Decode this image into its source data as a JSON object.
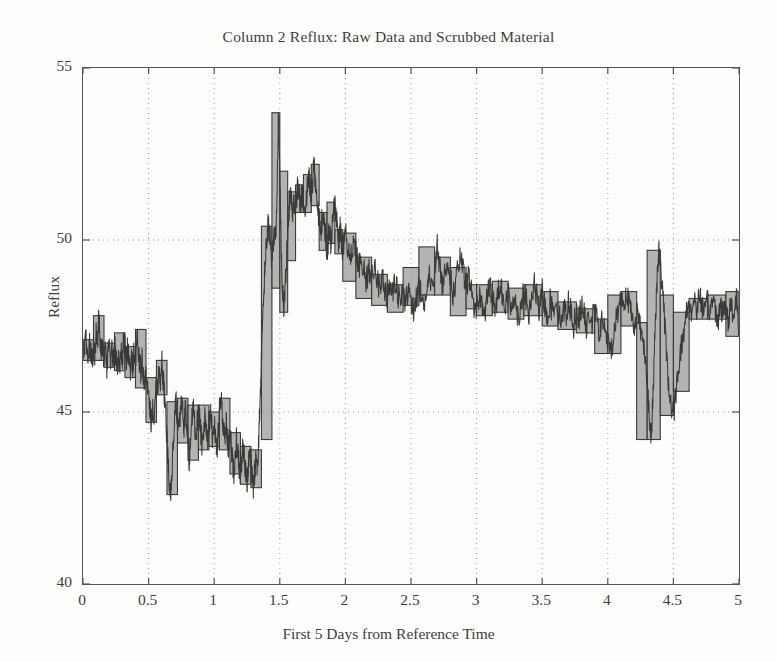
{
  "figure": {
    "title": "Column 2 Reflux: Raw Data and Scrubbed Material",
    "ylabel": "Reflux",
    "xlabel": "First 5 Days from Reference Time"
  },
  "style": {
    "background": "#fdfdfb",
    "axis_color": "#555555",
    "grid_color": "#9a9a9a",
    "raw_line_color": "#3a3a3a",
    "band_fill_color": "#9d9d9d",
    "band_edge_color": "#3a3a3a",
    "text_color": "#3d3d3d"
  },
  "chart_data": {
    "type": "line",
    "title": "Column 2 Reflux: Raw Data and Scrubbed Material",
    "xlabel": "First 5 Days from Reference Time",
    "ylabel": "Reflux",
    "xlim": [
      0,
      5
    ],
    "ylim": [
      40,
      55
    ],
    "xticks": [
      0,
      0.5,
      1,
      1.5,
      2,
      2.5,
      3,
      3.5,
      4,
      4.5,
      5
    ],
    "xtick_labels": [
      "0",
      "0.5",
      "1",
      "1.5",
      "2",
      "2.5",
      "3",
      "3.5",
      "4",
      "4.5",
      "5"
    ],
    "yticks": [
      40,
      45,
      50,
      55
    ],
    "ytick_labels": [
      "40",
      "45",
      "50",
      "55"
    ],
    "grid": true,
    "grid_style": "dotted",
    "legend": null,
    "legend_position": "none",
    "series": [
      {
        "name": "Raw Data",
        "kind": "line",
        "x": [
          0.0,
          0.01,
          0.02,
          0.03,
          0.04,
          0.05,
          0.06,
          0.07,
          0.08,
          0.09,
          0.1,
          0.11,
          0.12,
          0.13,
          0.14,
          0.15,
          0.16,
          0.17,
          0.18,
          0.19,
          0.2,
          0.21,
          0.22,
          0.23,
          0.24,
          0.25,
          0.26,
          0.27,
          0.28,
          0.29,
          0.3,
          0.31,
          0.32,
          0.33,
          0.34,
          0.35,
          0.36,
          0.37,
          0.38,
          0.39,
          0.4,
          0.41,
          0.42,
          0.43,
          0.44,
          0.45,
          0.46,
          0.47,
          0.48,
          0.49,
          0.5,
          0.51,
          0.52,
          0.53,
          0.54,
          0.55,
          0.56,
          0.57,
          0.58,
          0.59,
          0.6,
          0.61,
          0.62,
          0.63,
          0.64,
          0.65,
          0.66,
          0.67,
          0.68,
          0.69,
          0.7,
          0.71,
          0.72,
          0.73,
          0.74,
          0.75,
          0.76,
          0.77,
          0.78,
          0.79,
          0.8,
          0.81,
          0.82,
          0.83,
          0.84,
          0.85,
          0.86,
          0.87,
          0.88,
          0.89,
          0.9,
          0.91,
          0.92,
          0.93,
          0.94,
          0.95,
          0.96,
          0.97,
          0.98,
          0.99,
          1.0,
          1.01,
          1.02,
          1.03,
          1.04,
          1.05,
          1.06,
          1.07,
          1.08,
          1.09,
          1.1,
          1.11,
          1.12,
          1.13,
          1.14,
          1.15,
          1.16,
          1.17,
          1.18,
          1.19,
          1.2,
          1.21,
          1.22,
          1.23,
          1.24,
          1.25,
          1.26,
          1.27,
          1.28,
          1.29,
          1.3,
          1.31,
          1.32,
          1.33,
          1.34,
          1.35,
          1.36,
          1.37,
          1.38,
          1.39,
          1.4,
          1.41,
          1.42,
          1.43,
          1.44,
          1.45,
          1.46,
          1.47,
          1.48,
          1.49,
          1.5,
          1.51,
          1.52,
          1.53,
          1.54,
          1.55,
          1.56,
          1.57,
          1.58,
          1.59,
          1.6,
          1.61,
          1.62,
          1.63,
          1.64,
          1.65,
          1.66,
          1.67,
          1.68,
          1.69,
          1.7,
          1.71,
          1.72,
          1.73,
          1.74,
          1.75,
          1.76,
          1.77,
          1.78,
          1.79,
          1.8,
          1.81,
          1.82,
          1.83,
          1.84,
          1.85,
          1.86,
          1.87,
          1.88,
          1.89,
          1.9,
          1.91,
          1.92,
          1.93,
          1.94,
          1.95,
          1.96,
          1.97,
          1.98,
          1.99,
          2.0,
          2.02,
          2.04,
          2.06,
          2.08,
          2.1,
          2.12,
          2.14,
          2.16,
          2.18,
          2.2,
          2.22,
          2.24,
          2.26,
          2.28,
          2.3,
          2.32,
          2.34,
          2.36,
          2.38,
          2.4,
          2.42,
          2.44,
          2.46,
          2.48,
          2.5,
          2.52,
          2.54,
          2.56,
          2.58,
          2.6,
          2.62,
          2.64,
          2.66,
          2.68,
          2.7,
          2.72,
          2.74,
          2.76,
          2.78,
          2.8,
          2.82,
          2.84,
          2.86,
          2.88,
          2.9,
          2.92,
          2.94,
          2.96,
          2.98,
          3.0,
          3.02,
          3.04,
          3.06,
          3.08,
          3.1,
          3.12,
          3.14,
          3.16,
          3.18,
          3.2,
          3.22,
          3.24,
          3.26,
          3.28,
          3.3,
          3.32,
          3.34,
          3.36,
          3.38,
          3.4,
          3.42,
          3.44,
          3.46,
          3.48,
          3.5,
          3.52,
          3.54,
          3.56,
          3.58,
          3.6,
          3.62,
          3.64,
          3.66,
          3.68,
          3.7,
          3.72,
          3.74,
          3.76,
          3.78,
          3.8,
          3.82,
          3.84,
          3.86,
          3.88,
          3.9,
          3.92,
          3.94,
          3.96,
          3.98,
          4.0,
          4.02,
          4.04,
          4.06,
          4.08,
          4.1,
          4.12,
          4.14,
          4.16,
          4.18,
          4.2,
          4.22,
          4.24,
          4.26,
          4.28,
          4.3,
          4.31,
          4.32,
          4.33,
          4.34,
          4.35,
          4.36,
          4.37,
          4.38,
          4.39,
          4.4,
          4.42,
          4.44,
          4.46,
          4.48,
          4.5,
          4.52,
          4.54,
          4.56,
          4.58,
          4.6,
          4.62,
          4.64,
          4.66,
          4.68,
          4.7,
          4.72,
          4.74,
          4.76,
          4.78,
          4.8,
          4.82,
          4.84,
          4.86,
          4.88,
          4.9,
          4.92,
          4.94,
          4.96,
          4.98,
          5.0
        ],
        "y": [
          46.9,
          46.6,
          47.1,
          46.8,
          46.5,
          47.0,
          46.7,
          46.4,
          46.9,
          46.6,
          47.3,
          46.8,
          47.8,
          47.1,
          46.6,
          47.0,
          46.5,
          46.8,
          46.3,
          46.7,
          46.9,
          46.4,
          46.8,
          46.5,
          47.0,
          46.6,
          46.2,
          46.7,
          46.4,
          46.9,
          46.5,
          47.3,
          46.8,
          46.4,
          46.9,
          46.5,
          46.1,
          46.6,
          46.3,
          46.8,
          46.4,
          47.4,
          46.9,
          46.5,
          46.2,
          46.6,
          46.1,
          45.7,
          46.2,
          45.8,
          45.4,
          45.0,
          44.7,
          45.2,
          44.9,
          45.5,
          46.0,
          45.6,
          46.3,
          45.9,
          46.5,
          46.0,
          45.5,
          44.9,
          44.2,
          43.4,
          42.7,
          42.6,
          43.5,
          44.2,
          44.9,
          45.3,
          44.8,
          44.3,
          44.9,
          45.4,
          45.0,
          44.5,
          45.1,
          44.6,
          44.1,
          43.6,
          44.2,
          44.8,
          45.2,
          44.7,
          44.2,
          44.7,
          45.2,
          44.8,
          44.3,
          43.9,
          44.4,
          44.9,
          44.5,
          44.0,
          44.5,
          45.0,
          44.6,
          44.2,
          44.7,
          44.3,
          43.9,
          44.4,
          44.9,
          45.4,
          45.0,
          44.6,
          44.2,
          44.7,
          44.3,
          43.9,
          44.4,
          44.0,
          43.6,
          43.2,
          43.7,
          44.2,
          43.8,
          43.4,
          43.0,
          43.5,
          44.0,
          43.6,
          43.2,
          42.9,
          43.4,
          43.9,
          43.5,
          43.1,
          42.8,
          43.3,
          43.8,
          43.4,
          44.2,
          45.4,
          46.6,
          47.6,
          48.6,
          49.4,
          50.0,
          50.4,
          50.2,
          49.8,
          49.4,
          49.9,
          50.4,
          50.2,
          51.5,
          53.7,
          52.0,
          49.9,
          48.6,
          47.9,
          48.6,
          49.4,
          50.2,
          50.9,
          51.4,
          51.1,
          50.8,
          51.2,
          50.9,
          51.3,
          51.6,
          51.3,
          51.0,
          51.4,
          51.1,
          50.8,
          51.2,
          51.5,
          51.9,
          51.6,
          51.3,
          51.7,
          52.2,
          51.8,
          51.4,
          51.0,
          50.6,
          50.2,
          50.5,
          50.8,
          50.4,
          50.1,
          49.7,
          50.0,
          50.3,
          49.9,
          50.4,
          50.8,
          51.1,
          50.7,
          50.3,
          49.9,
          50.3,
          50.0,
          49.6,
          49.9,
          50.2,
          49.8,
          49.5,
          49.9,
          49.6,
          49.2,
          49.5,
          49.1,
          48.8,
          49.2,
          48.9,
          49.3,
          48.9,
          48.6,
          49.0,
          48.6,
          48.3,
          48.7,
          48.4,
          48.8,
          48.4,
          48.1,
          48.5,
          48.2,
          48.6,
          48.3,
          47.9,
          48.3,
          48.7,
          48.4,
          48.1,
          48.5,
          48.9,
          48.6,
          49.2,
          49.8,
          49.2,
          48.7,
          49.1,
          49.5,
          48.9,
          48.4,
          48.8,
          49.2,
          49.5,
          49.0,
          48.6,
          49.0,
          48.5,
          48.1,
          48.0,
          48.4,
          48.2,
          47.8,
          48.3,
          48.7,
          48.3,
          47.9,
          48.4,
          48.8,
          48.4,
          48.0,
          48.5,
          48.0,
          48.4,
          48.1,
          47.7,
          48.2,
          48.6,
          48.2,
          47.8,
          48.3,
          48.7,
          48.3,
          47.9,
          48.5,
          48.1,
          47.8,
          48.2,
          47.9,
          48.3,
          48.0,
          47.6,
          48.1,
          47.8,
          48.2,
          47.9,
          47.5,
          48.0,
          47.7,
          48.1,
          47.8,
          47.4,
          47.9,
          47.6,
          48.0,
          47.6,
          47.3,
          47.7,
          47.4,
          47.0,
          46.7,
          47.1,
          47.6,
          48.0,
          48.4,
          48.1,
          48.5,
          48.2,
          47.8,
          47.5,
          47.9,
          47.6,
          47.2,
          46.9,
          46.0,
          45.2,
          44.5,
          44.2,
          45.0,
          46.2,
          47.4,
          48.4,
          49.2,
          49.7,
          49.3,
          48.4,
          47.2,
          46.0,
          45.2,
          44.9,
          45.6,
          46.4,
          46.9,
          47.3,
          47.9,
          48.2,
          47.9,
          48.3,
          48.0,
          48.4,
          48.1,
          47.8,
          48.2,
          47.9,
          48.3,
          48.0,
          47.7,
          48.1,
          47.8,
          48.2,
          47.5,
          48.4,
          47.6,
          48.5,
          47.2
        ]
      },
      {
        "name": "Scrubbed Material",
        "kind": "band",
        "note": "Gray-filled rectangles spanning each scrub window; each block gives [x_start, x_end, y_low, y_high].",
        "blocks": [
          [
            0.0,
            0.08,
            46.5,
            47.1
          ],
          [
            0.08,
            0.16,
            46.5,
            47.8
          ],
          [
            0.16,
            0.24,
            46.3,
            47.0
          ],
          [
            0.24,
            0.32,
            46.2,
            47.3
          ],
          [
            0.32,
            0.4,
            46.0,
            46.9
          ],
          [
            0.4,
            0.48,
            45.7,
            47.4
          ],
          [
            0.48,
            0.56,
            44.7,
            46.0
          ],
          [
            0.56,
            0.64,
            45.5,
            46.5
          ],
          [
            0.64,
            0.72,
            42.6,
            45.3
          ],
          [
            0.72,
            0.8,
            44.1,
            45.4
          ],
          [
            0.8,
            0.88,
            43.6,
            45.2
          ],
          [
            0.88,
            0.96,
            43.9,
            45.2
          ],
          [
            0.96,
            1.04,
            44.0,
            45.0
          ],
          [
            1.04,
            1.12,
            43.9,
            45.4
          ],
          [
            1.12,
            1.2,
            43.2,
            44.4
          ],
          [
            1.2,
            1.28,
            42.9,
            44.0
          ],
          [
            1.28,
            1.36,
            42.8,
            43.9
          ],
          [
            1.36,
            1.44,
            44.2,
            50.4
          ],
          [
            1.44,
            1.5,
            48.6,
            53.7
          ],
          [
            1.5,
            1.56,
            47.9,
            52.0
          ],
          [
            1.56,
            1.62,
            49.4,
            51.4
          ],
          [
            1.62,
            1.68,
            50.8,
            51.6
          ],
          [
            1.68,
            1.74,
            50.8,
            51.9
          ],
          [
            1.74,
            1.8,
            51.0,
            52.2
          ],
          [
            1.8,
            1.86,
            49.7,
            50.8
          ],
          [
            1.86,
            1.92,
            49.9,
            51.1
          ],
          [
            1.92,
            1.98,
            49.6,
            50.3
          ],
          [
            1.98,
            2.08,
            48.8,
            50.2
          ],
          [
            2.08,
            2.2,
            48.3,
            49.5
          ],
          [
            2.2,
            2.32,
            48.1,
            49.0
          ],
          [
            2.32,
            2.44,
            47.9,
            48.7
          ],
          [
            2.44,
            2.56,
            48.1,
            49.2
          ],
          [
            2.56,
            2.68,
            48.4,
            49.8
          ],
          [
            2.68,
            2.8,
            48.4,
            49.5
          ],
          [
            2.8,
            2.92,
            47.8,
            49.2
          ],
          [
            2.92,
            3.0,
            48.0,
            48.7
          ],
          [
            3.0,
            3.12,
            47.8,
            48.7
          ],
          [
            3.12,
            3.24,
            47.9,
            48.8
          ],
          [
            3.24,
            3.36,
            47.7,
            48.6
          ],
          [
            3.36,
            3.5,
            47.8,
            48.7
          ],
          [
            3.5,
            3.62,
            47.5,
            48.5
          ],
          [
            3.62,
            3.76,
            47.4,
            48.2
          ],
          [
            3.76,
            3.9,
            47.3,
            48.0
          ],
          [
            3.9,
            4.0,
            46.7,
            47.7
          ],
          [
            4.0,
            4.1,
            46.7,
            48.4
          ],
          [
            4.1,
            4.22,
            47.5,
            48.5
          ],
          [
            4.22,
            4.3,
            44.2,
            47.6
          ],
          [
            4.3,
            4.4,
            44.2,
            49.7
          ],
          [
            4.4,
            4.5,
            44.9,
            48.4
          ],
          [
            4.5,
            4.62,
            45.6,
            47.9
          ],
          [
            4.62,
            4.76,
            47.7,
            48.3
          ],
          [
            4.76,
            4.9,
            47.7,
            48.4
          ],
          [
            4.9,
            5.0,
            47.2,
            48.5
          ]
        ]
      }
    ]
  }
}
